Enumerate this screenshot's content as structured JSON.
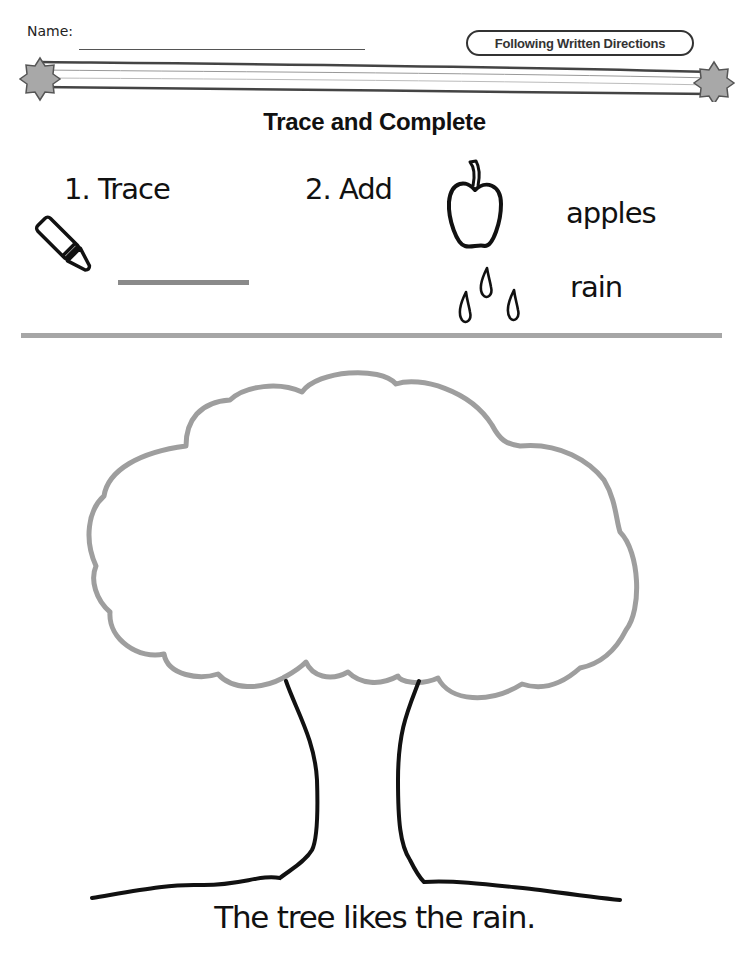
{
  "header": {
    "name_label": "Name:",
    "name_value": "",
    "badge": "Following Written Directions"
  },
  "worksheet": {
    "title": "Trace and Complete",
    "instructions": [
      {
        "number": "1.",
        "verb": "Trace",
        "text": "1. Trace",
        "icon": "crayon-icon"
      },
      {
        "number": "2.",
        "verb": "Add",
        "text": "2. Add",
        "items": [
          {
            "icon": "apple-icon",
            "label": "apples"
          },
          {
            "icon": "raindrops-icon",
            "label": "rain"
          }
        ]
      }
    ],
    "sentence": "The tree likes the rain."
  },
  "colors": {
    "ink": "#111111",
    "trace_gray": "#8a8a8a",
    "canopy_gray": "#9e9e9e",
    "divider_gray": "#a6a6a6",
    "star_fill": "#a8a8a8"
  }
}
